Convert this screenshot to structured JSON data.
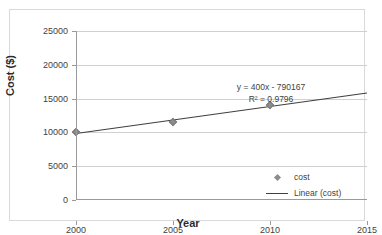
{
  "chart_data": {
    "type": "scatter",
    "title": "",
    "xlabel": "Year",
    "ylabel": "Cost ($)",
    "xlim": [
      2000,
      2015
    ],
    "ylim": [
      0,
      25000
    ],
    "grid": "horizontal",
    "x": [
      2000,
      2005,
      2010
    ],
    "series": [
      {
        "name": "cost",
        "values": [
          10000,
          11500,
          14000
        ],
        "marker": "diamond",
        "color": "#8c8c8c"
      },
      {
        "name": "Linear (cost)",
        "type": "trendline",
        "equation": "y = 400x - 790167",
        "r_squared": "R² = 0.9796",
        "slope": 400,
        "intercept": -790167,
        "endpoints": [
          [
            2000,
            9833
          ],
          [
            2015,
            15833
          ]
        ],
        "color": "#3f3f3f"
      }
    ],
    "xticks": [
      {
        "value": 2000,
        "label": "2000"
      },
      {
        "value": 2005,
        "label": "2005"
      },
      {
        "value": 2010,
        "label": "2010"
      },
      {
        "value": 2015,
        "label": "2015"
      }
    ],
    "yticks": [
      {
        "value": 0,
        "label": "0"
      },
      {
        "value": 5000,
        "label": "5000"
      },
      {
        "value": 10000,
        "label": "10000"
      },
      {
        "value": 15000,
        "label": "15000"
      },
      {
        "value": 20000,
        "label": "20000"
      },
      {
        "value": 25000,
        "label": "25000"
      }
    ],
    "annotations": [
      {
        "name": "equation",
        "text": "y = 400x - 790167"
      },
      {
        "name": "r-squared",
        "text": "R² = 0.9796"
      }
    ],
    "legend": {
      "position": "inside-center",
      "entries": [
        {
          "label": "cost",
          "swatch": "diamond-marker"
        },
        {
          "label": "Linear (cost)",
          "swatch": "line"
        }
      ]
    },
    "colors": {
      "marker": "#8c8c8c",
      "trendline": "#3f3f3f",
      "gridline": "#d0d0d0",
      "axis": "#9a9a9a",
      "frame": "#d9d9d9",
      "text": "#3f3f3f",
      "title_text": "#2b2b2b",
      "background": "#ffffff"
    }
  }
}
